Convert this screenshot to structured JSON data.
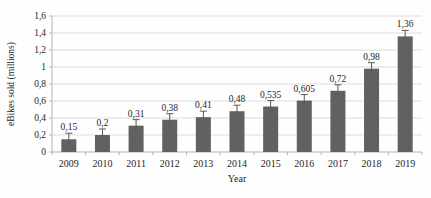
{
  "chart_data": {
    "type": "bar",
    "title": "",
    "xlabel": "Year",
    "ylabel": "eBikes sold (millions)",
    "categories": [
      "2009",
      "2010",
      "2011",
      "2012",
      "2013",
      "2014",
      "2015",
      "2016",
      "2017",
      "2018",
      "2019"
    ],
    "values": [
      0.15,
      0.2,
      0.31,
      0.38,
      0.41,
      0.48,
      0.535,
      0.605,
      0.72,
      0.98,
      1.36
    ],
    "value_labels": [
      "0,15",
      "0,2",
      "0,31",
      "0,38",
      "0,41",
      "0,48",
      "0,535",
      "0,605",
      "0,72",
      "0,98",
      "1,36"
    ],
    "y_ticks": [
      0,
      0.2,
      0.4,
      0.6,
      0.8,
      1,
      1.2,
      1.4,
      1.6
    ],
    "y_tick_labels": [
      "0",
      "0,2",
      "0,4",
      "0,6",
      "0,8",
      "1",
      "1,2",
      "1,4",
      "1,6"
    ],
    "ylim": [
      0,
      1.6
    ],
    "grid": true,
    "legend": "none",
    "error_bars": true,
    "decimal_separator": ",",
    "colors": {
      "bar": "#616161",
      "grid": "#dcdcdc",
      "axis": "#b3b3b3",
      "text": "#262626",
      "error_bar": "#595959",
      "background": "#fefefe"
    }
  }
}
